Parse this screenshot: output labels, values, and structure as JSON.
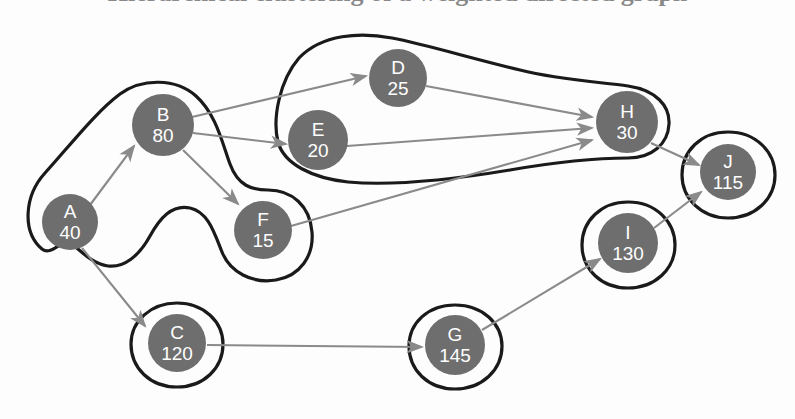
{
  "figure": {
    "title_partial": "Hierarchical clustering of a weighted directed graph",
    "background_color": "#fdfdfd",
    "node_fill": "#6e6e6e",
    "node_text_color": "#ffffff",
    "edge_color": "#8a8a8a",
    "outline_color": "#1a1a1a"
  },
  "chart_data": {
    "type": "diagram",
    "diagram_kind": "directed-graph-with-clusters",
    "title": "",
    "nodes": [
      {
        "id": "A",
        "value": "40",
        "cx": 70,
        "cy": 222,
        "r": 28
      },
      {
        "id": "B",
        "value": "80",
        "cx": 163,
        "cy": 125,
        "r": 31
      },
      {
        "id": "C",
        "value": "120",
        "cx": 177,
        "cy": 343,
        "r": 29
      },
      {
        "id": "D",
        "value": "25",
        "cx": 398,
        "cy": 78,
        "r": 29
      },
      {
        "id": "E",
        "value": "20",
        "cx": 318,
        "cy": 140,
        "r": 30
      },
      {
        "id": "F",
        "value": "15",
        "cx": 263,
        "cy": 230,
        "r": 29
      },
      {
        "id": "G",
        "value": "145",
        "cx": 455,
        "cy": 345,
        "r": 30
      },
      {
        "id": "H",
        "value": "30",
        "cx": 627,
        "cy": 122,
        "r": 31
      },
      {
        "id": "I",
        "value": "130",
        "cx": 628,
        "cy": 243,
        "r": 30
      },
      {
        "id": "J",
        "value": "115",
        "cx": 728,
        "cy": 172,
        "r": 28
      }
    ],
    "edges": [
      {
        "from": "A",
        "to": "B"
      },
      {
        "from": "A",
        "to": "C"
      },
      {
        "from": "B",
        "to": "D"
      },
      {
        "from": "B",
        "to": "F"
      },
      {
        "from": "B",
        "to": "E"
      },
      {
        "from": "D",
        "to": "H"
      },
      {
        "from": "E",
        "to": "H"
      },
      {
        "from": "F",
        "to": "H"
      },
      {
        "from": "H",
        "to": "J"
      },
      {
        "from": "C",
        "to": "G"
      },
      {
        "from": "G",
        "to": "I"
      },
      {
        "from": "I",
        "to": "J"
      }
    ],
    "clusters": [
      {
        "name": "cluster-ABF",
        "members": [
          "A",
          "B",
          "F"
        ]
      },
      {
        "name": "cluster-DEH",
        "members": [
          "D",
          "E",
          "H"
        ]
      },
      {
        "name": "cluster-C",
        "members": [
          "C"
        ]
      },
      {
        "name": "cluster-G",
        "members": [
          "G"
        ]
      },
      {
        "name": "cluster-I",
        "members": [
          "I"
        ]
      },
      {
        "name": "cluster-J",
        "members": [
          "J"
        ]
      }
    ]
  }
}
